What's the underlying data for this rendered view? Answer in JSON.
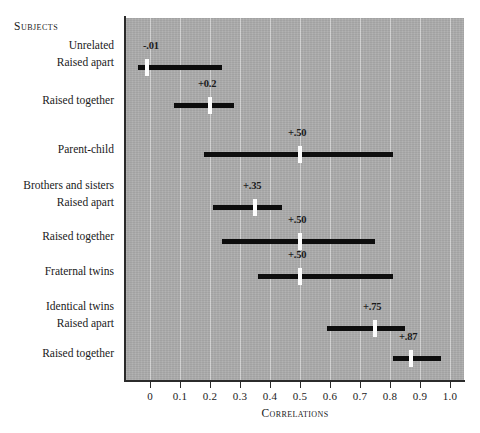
{
  "chart_data": {
    "type": "bar",
    "title": "",
    "xlabel": "Correlations",
    "ylabel": "Subjects",
    "xlim": [
      -0.05,
      1.0
    ],
    "ylim": [
      0,
      8
    ],
    "grid": true,
    "legend": false,
    "orientation": "horizontal",
    "tick_labels": [
      "0",
      "0.1",
      "0.2",
      "0.3",
      "0.4",
      "0.5",
      "0.6",
      "0.7",
      "0.8",
      "0.9",
      "1.0"
    ],
    "tick_values": [
      0,
      0.1,
      0.2,
      0.3,
      0.4,
      0.5,
      0.6,
      0.7,
      0.8,
      0.9,
      1.0
    ],
    "categories": [
      "Unrelated / Raised apart",
      "Unrelated / Raised together",
      "Parent-child",
      "Brothers and sisters / Raised apart",
      "Brothers and sisters / Raised together",
      "Fraternal twins",
      "Identical twins / Raised apart",
      "Identical twins / Raised together"
    ],
    "values": [
      -0.01,
      0.2,
      0.5,
      0.35,
      0.5,
      0.5,
      0.75,
      0.87
    ],
    "ranges": [
      [
        -0.04,
        0.24
      ],
      [
        0.08,
        0.28
      ],
      [
        0.18,
        0.81
      ],
      [
        0.21,
        0.44
      ],
      [
        0.24,
        0.75
      ],
      [
        0.36,
        0.81
      ],
      [
        0.59,
        0.85
      ],
      [
        0.81,
        0.97
      ]
    ],
    "value_labels": [
      "-.01",
      "+0.2",
      "+.50",
      "+.35",
      "+.50",
      "+.50",
      "+.75",
      "+.87"
    ]
  },
  "axis": {
    "x_title": "Correlations",
    "ticks": [
      {
        "label": "0",
        "value": 0
      },
      {
        "label": "0.1",
        "value": 0.1
      },
      {
        "label": "0.2",
        "value": 0.2
      },
      {
        "label": "0.3",
        "value": 0.3
      },
      {
        "label": "0.4",
        "value": 0.4
      },
      {
        "label": "0.5",
        "value": 0.5
      },
      {
        "label": "0.6",
        "value": 0.6
      },
      {
        "label": "0.7",
        "value": 0.7
      },
      {
        "label": "0.8",
        "value": 0.8
      },
      {
        "label": "0.9",
        "value": 0.9
      },
      {
        "label": "1.0",
        "value": 1.0
      }
    ]
  },
  "sidebar": {
    "heading": "Subjects",
    "groups": [
      {
        "label": "Unrelated"
      },
      {
        "label": "Brothers and sisters"
      },
      {
        "label": "Identical twins"
      }
    ],
    "rows": [
      {
        "label": "Raised apart"
      },
      {
        "label": "Raised together"
      },
      {
        "label": "Parent-child"
      },
      {
        "label": "Raised apart"
      },
      {
        "label": "Raised together"
      },
      {
        "label": "Fraternal twins"
      },
      {
        "label": "Raised apart"
      },
      {
        "label": "Raised together"
      }
    ]
  },
  "colors": {
    "panel": "#adadad",
    "bar": "#0d0d0d",
    "marker": "#fdfdfd",
    "gridline": "#ffffff",
    "axis": "#2b2b2b",
    "text": "#1a1a1a",
    "background": "#ffffff"
  }
}
